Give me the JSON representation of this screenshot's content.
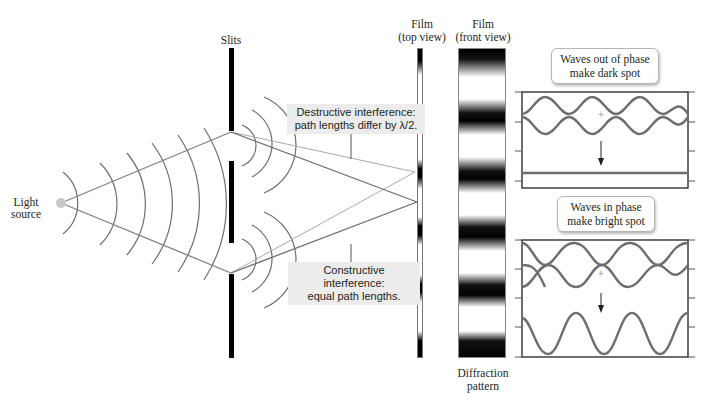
{
  "labels": {
    "slits": "Slits",
    "light_source_line1": "Light",
    "light_source_line2": "source",
    "film_top_line1": "Film",
    "film_top_line2": "(top view)",
    "film_front_line1": "Film",
    "film_front_line2": "(front view)",
    "diffraction_line1": "Diffraction",
    "diffraction_line2": "pattern"
  },
  "callouts": {
    "destructive_line1": "Destructive interference:",
    "destructive_line2": "path lengths differ by λ/2.",
    "constructive_line1": "Constructive interference:",
    "constructive_line2": "equal path lengths."
  },
  "wave_panels": {
    "out_of_phase": {
      "line1": "Waves out of phase",
      "line2": "make dark spot",
      "plus": "+"
    },
    "in_phase": {
      "line1": "Waves in phase",
      "line2": "make bright spot",
      "plus": "+"
    }
  },
  "colors": {
    "ray": "#808080",
    "wave": "#6d6e71",
    "barrier": "#000000",
    "callout_bg": "#ececec"
  },
  "pattern": {
    "dark_band_centers_y": [
      55,
      113,
      171,
      228,
      286,
      345
    ],
    "bright_band_centers_y": [
      84,
      142,
      200,
      257,
      315
    ]
  }
}
